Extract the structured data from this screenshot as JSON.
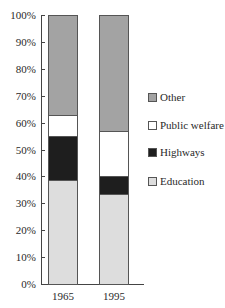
{
  "chart_data": {
    "type": "bar",
    "stacked": true,
    "title": "",
    "xlabel": "",
    "ylabel": "",
    "ylim": [
      0,
      100
    ],
    "y_ticks": [
      "0%",
      "10%",
      "20%",
      "30%",
      "40%",
      "50%",
      "60%",
      "70%",
      "80%",
      "90%",
      "100%"
    ],
    "categories": [
      "1965",
      "1995"
    ],
    "series": [
      {
        "name": "Education",
        "color": "#dddddd",
        "values": [
          38.5,
          33.5
        ]
      },
      {
        "name": "Highways",
        "color": "#1e1e1e",
        "values": [
          16.5,
          6.5
        ]
      },
      {
        "name": "Public welfare",
        "color": "#ffffff",
        "values": [
          8,
          17
        ]
      },
      {
        "name": "Other",
        "color": "#a3a3a3",
        "values": [
          37,
          43
        ]
      }
    ],
    "legend": {
      "position": "right",
      "entries": [
        "Other",
        "Public welfare",
        "Highways",
        "Education"
      ]
    },
    "grid": false
  }
}
